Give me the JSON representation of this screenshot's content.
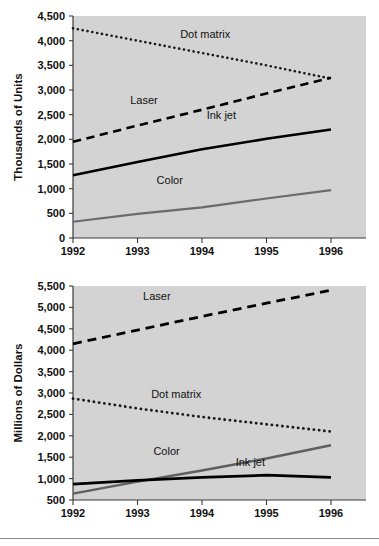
{
  "figure": {
    "background_color": "#ffffff",
    "plot_background_color": "#d3d3d3",
    "footer_rule": true
  },
  "chart_data": [
    {
      "id": "printer-unit-shipments",
      "type": "line",
      "title": "",
      "subtitle": "",
      "xlabel": "",
      "ylabel": "Thousands of Units",
      "x": [
        1992,
        1993,
        1994,
        1995,
        1996
      ],
      "xticklabels": [
        "1992",
        "1993",
        "1994",
        "1995",
        "1996"
      ],
      "ylim": [
        0,
        4500
      ],
      "yticks": [
        0,
        500,
        1000,
        1500,
        2000,
        2500,
        3000,
        3500,
        4000,
        4500
      ],
      "yticklabels": [
        "0",
        "500",
        "1,000",
        "1,500",
        "2,000",
        "2,500",
        "3,000",
        "3,500",
        "4,000",
        "4,500"
      ],
      "grid": false,
      "legend": "inline-labels",
      "series": [
        {
          "name": "Dot matrix",
          "style": "dotted",
          "color": "#1a1a1a",
          "width": 2.6,
          "values": [
            4250,
            4000,
            3750,
            3500,
            3230
          ],
          "label_x": 1994.05,
          "label_y": 4060
        },
        {
          "name": "Laser",
          "style": "dashed",
          "color": "#000000",
          "width": 2.6,
          "values": [
            1950,
            2280,
            2600,
            2930,
            3250
          ],
          "label_x": 1993.1,
          "label_y": 2720
        },
        {
          "name": "Ink jet",
          "style": "solid",
          "color": "#000000",
          "width": 2.6,
          "values": [
            1270,
            1540,
            1800,
            2010,
            2200
          ],
          "label_x": 1994.3,
          "label_y": 2420
        },
        {
          "name": "Color",
          "style": "solid",
          "color": "#6b6b6b",
          "width": 2.2,
          "values": [
            330,
            490,
            620,
            800,
            970
          ],
          "label_x": 1993.5,
          "label_y": 1100
        }
      ]
    },
    {
      "id": "printer-dollar-shipments",
      "type": "line",
      "title": "",
      "subtitle": "",
      "xlabel": "",
      "ylabel": "Millions of Dollars",
      "x": [
        1992,
        1993,
        1994,
        1995,
        1996
      ],
      "xticklabels": [
        "1992",
        "1993",
        "1994",
        "1995",
        "1996"
      ],
      "ylim": [
        500,
        5500
      ],
      "yticks": [
        500,
        1000,
        1500,
        2000,
        2500,
        3000,
        3500,
        4000,
        4500,
        5000,
        5500
      ],
      "yticklabels": [
        "500",
        "1,000",
        "1,500",
        "2,000",
        "2,500",
        "3,000",
        "3,500",
        "4,000",
        "4,500",
        "5,000",
        "5,500"
      ],
      "grid": false,
      "legend": "inline-labels",
      "series": [
        {
          "name": "Laser",
          "style": "dashed",
          "color": "#000000",
          "width": 2.8,
          "values": [
            4150,
            4470,
            4790,
            5100,
            5400
          ],
          "label_x": 1993.3,
          "label_y": 5170
        },
        {
          "name": "Dot matrix",
          "style": "dotted",
          "color": "#1a1a1a",
          "width": 2.8,
          "values": [
            2870,
            2640,
            2440,
            2270,
            2100
          ],
          "label_x": 1993.6,
          "label_y": 2880
        },
        {
          "name": "Color",
          "style": "solid",
          "color": "#5f5f5f",
          "width": 2.4,
          "values": [
            650,
            930,
            1190,
            1470,
            1780
          ],
          "label_x": 1993.45,
          "label_y": 1560
        },
        {
          "name": "Ink jet",
          "style": "solid",
          "color": "#000000",
          "width": 2.8,
          "values": [
            870,
            960,
            1030,
            1080,
            1030
          ],
          "label_x": 1994.75,
          "label_y": 1290
        }
      ]
    }
  ]
}
